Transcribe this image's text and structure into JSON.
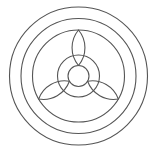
{
  "diagram": {
    "type": "geometric-line-drawing",
    "stroke_color": "#555555",
    "background": "#ffffff",
    "center": [
      78.5,
      76
    ],
    "rings": [
      {
        "name": "outer-ring",
        "r": 69
      },
      {
        "name": "middle-ring",
        "r": 57.5
      },
      {
        "name": "inner-ring",
        "r": 46
      }
    ],
    "medium_circle": {
      "r": 21
    },
    "center_circle": {
      "r": 10.5
    },
    "petals": [
      {
        "name": "top-petal",
        "angle": -90
      },
      {
        "name": "lower-right-petal",
        "angle": 30
      },
      {
        "name": "lower-left-petal",
        "angle": 150
      }
    ]
  }
}
